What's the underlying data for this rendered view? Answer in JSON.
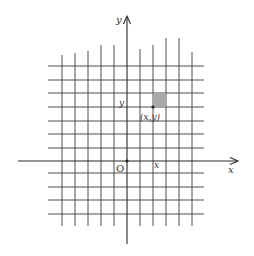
{
  "diagram": {
    "title": "",
    "axes": {
      "x_label": "x",
      "y_label": "y",
      "origin_label": "O",
      "color": "#2a2a2a"
    },
    "grid": {
      "color": "#3a3a3a",
      "vertical_x": [
        62,
        75,
        88,
        101,
        114,
        140,
        153,
        166,
        179,
        192
      ],
      "vertical_top": [
        55,
        53,
        51,
        45,
        45,
        49,
        45,
        38,
        38,
        52
      ],
      "vertical_bottom": 226,
      "horizontal_y": [
        66,
        80,
        93,
        107,
        121,
        134,
        148,
        173,
        187,
        200,
        214
      ],
      "horizontal_left": 48,
      "horizontal_right": 204
    },
    "point": {
      "label": "(x,y)",
      "x_tick_label": "x",
      "y_tick_label": "y"
    },
    "shaded_cell": {
      "fill": "#a9a9a9",
      "description": "unit square above-right of point (x,y)"
    }
  }
}
